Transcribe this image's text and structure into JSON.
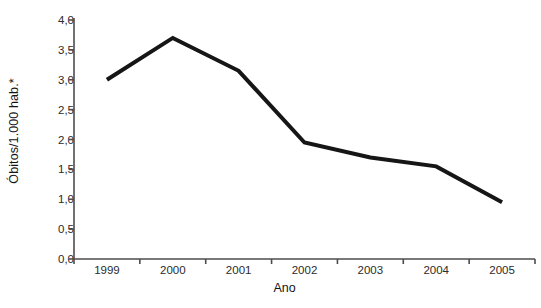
{
  "chart_data": {
    "type": "line",
    "title": "",
    "subtitle": "",
    "xlabel": "Ano",
    "ylabel": "Óbitos/1.000 hab.*",
    "categories": [
      "1999",
      "2000",
      "2001",
      "2002",
      "2003",
      "2004",
      "2005"
    ],
    "values": [
      3.0,
      3.7,
      3.15,
      1.95,
      1.7,
      1.55,
      0.95
    ],
    "series": [
      {
        "name": "Óbitos/1.000 hab.",
        "values": [
          3.0,
          3.7,
          3.15,
          1.95,
          1.7,
          1.55,
          0.95
        ]
      }
    ],
    "ylim": [
      0.0,
      4.0
    ],
    "ytick_labels": [
      "0,0",
      "0,5",
      "1,0",
      "1,5",
      "2,0",
      "2,5",
      "3,0",
      "3,5",
      "4,0"
    ],
    "ytick_values": [
      0.0,
      0.5,
      1.0,
      1.5,
      2.0,
      2.5,
      3.0,
      3.5,
      4.0
    ],
    "xtick_labels": [
      "1999",
      "2000",
      "2001",
      "2002",
      "2003",
      "2004",
      "2005"
    ],
    "grid": false,
    "legend": false,
    "legend_position": "none",
    "line_color": "#161616",
    "line_width": 4,
    "axis_color": "#4d4d4d",
    "background_color": "#ffffff",
    "markers": false,
    "annotations": []
  },
  "axes": {
    "y_title": "Óbitos/1.000 hab.*",
    "x_title": "Ano"
  }
}
